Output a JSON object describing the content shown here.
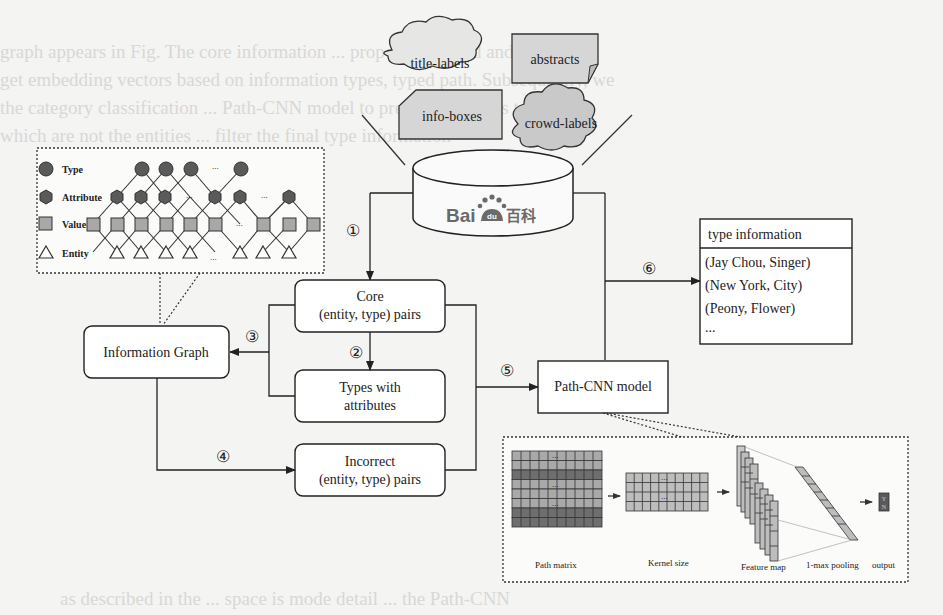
{
  "background_text": [
    "graph appears in Fig. The core information ... proposed method and graph",
    "get embedding vectors based on information types, typed path. Subsequently, we",
    "the category classification ... Path-CNN model to predict the labels to predict",
    "which are not the entities ... filter the final type information",
    "as described in the ... space is mode detail ... the Path-CNN"
  ],
  "sources": {
    "title_labels": "title-labels",
    "abstracts": "abstracts",
    "info_boxes": "info-boxes",
    "crowd_labels": "crowd-labels"
  },
  "database": {
    "logo_latin": "Bai",
    "logo_du": "du",
    "logo_cjk": "百科"
  },
  "legend": {
    "type": "Type",
    "attribute": "Attribute",
    "value": "Value",
    "entity": "Entity"
  },
  "graph": {
    "ellipsis": "..."
  },
  "nodes": {
    "information_graph": "Information Graph",
    "core_line1": "Core",
    "core_line2": "(entity, type) pairs",
    "types_line1": "Types with",
    "types_line2": "attributes",
    "incorrect_line1": "Incorrect",
    "incorrect_line2": "(entity, type) pairs",
    "path_cnn": "Path-CNN model"
  },
  "steps": [
    "①",
    "②",
    "③",
    "④",
    "⑤",
    "⑥"
  ],
  "type_info": {
    "header": "type information",
    "rows": [
      "(Jay Chou, Singer)",
      "(New York, City)",
      "(Peony,  Flower)",
      "..."
    ]
  },
  "cnn": {
    "path_matrix": "Path matrix",
    "kernel_size": "Kernel size",
    "feature_map": "Feature map",
    "pooling": "1-max pooling",
    "output": "output",
    "output_y": "Y",
    "output_n": "N",
    "ellipsis": "..."
  },
  "colors": {
    "box_fill": "#ffffff",
    "source_fill": "#d6d6d6",
    "node_dark": "#5a5a5a",
    "value_fill": "#a8a8a8",
    "matrix_light": "#a9a9a9",
    "matrix_dark": "#6e6e6e",
    "line": "#222222"
  }
}
